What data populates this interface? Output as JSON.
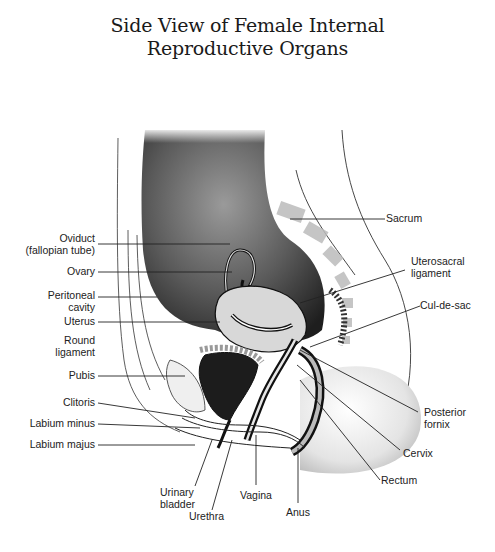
{
  "title": {
    "line1": "Side View of Female Internal",
    "line2": "Reproductive Organs"
  },
  "labels_left": [
    {
      "id": "oviduct",
      "line1": "Oviduct",
      "line2": "(fallopian tube)"
    },
    {
      "id": "ovary",
      "line1": "Ovary"
    },
    {
      "id": "peritoneal-cavity",
      "line1": "Peritoneal",
      "line2": "cavity"
    },
    {
      "id": "uterus",
      "line1": "Uterus"
    },
    {
      "id": "round-ligament",
      "line1": "Round",
      "line2": "ligament"
    },
    {
      "id": "pubis",
      "line1": "Pubis"
    },
    {
      "id": "clitoris",
      "line1": "Clitoris"
    },
    {
      "id": "labium-minus",
      "line1": "Labium minus"
    },
    {
      "id": "labium-majus",
      "line1": "Labium majus"
    }
  ],
  "labels_right": [
    {
      "id": "sacrum",
      "line1": "Sacrum"
    },
    {
      "id": "uterosacral-ligament",
      "line1": "Uterosacral",
      "line2": "ligament"
    },
    {
      "id": "cul-de-sac",
      "line1": "Cul-de-sac"
    },
    {
      "id": "posterior-fornix",
      "line1": "Posterior",
      "line2": "fornix"
    },
    {
      "id": "cervix",
      "line1": "Cervix"
    },
    {
      "id": "rectum",
      "line1": "Rectum"
    }
  ],
  "labels_bottom": [
    {
      "id": "urinary-bladder",
      "line1": "Urinary",
      "line2": "bladder"
    },
    {
      "id": "urethra",
      "line1": "Urethra"
    },
    {
      "id": "vagina",
      "line1": "Vagina"
    },
    {
      "id": "anus",
      "line1": "Anus"
    }
  ]
}
